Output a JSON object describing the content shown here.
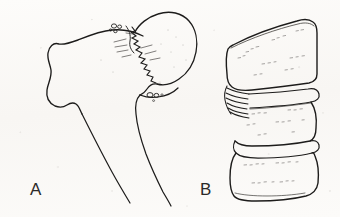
{
  "figure": {
    "background_color": "#fbfaf8",
    "ink_color": "#1d1c1b",
    "panels": [
      {
        "id": "A",
        "label": "A",
        "subject": "proximal femur with femoral neck fracture",
        "features": [
          "greater trochanter",
          "femoral head",
          "jagged subcapital fracture line",
          "femoral shaft",
          "lesser trochanter",
          "trabecular void circles"
        ]
      },
      {
        "id": "B",
        "label": "B",
        "subject": "lumbar vertebral bodies with compression wedge fracture",
        "features": [
          "wedge-compressed upper vertebral body",
          "collapsed anterior cortex folds",
          "intervertebral disc space",
          "biconcave lower vertebral body",
          "stippled cancellous texture"
        ]
      }
    ],
    "icons": {
      "panel_label_a": "letter-a-glyph",
      "panel_label_b": "letter-b-glyph"
    }
  }
}
